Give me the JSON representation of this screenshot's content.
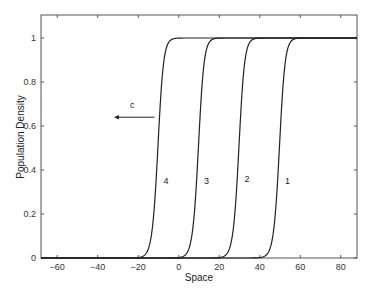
{
  "chart_data": {
    "type": "line",
    "title": "",
    "xlabel": "Space",
    "ylabel": "Population Density",
    "xlim": [
      -68,
      88
    ],
    "ylim": [
      0,
      1.08
    ],
    "xticks": [
      -60,
      -40,
      -20,
      0,
      20,
      40,
      60,
      80
    ],
    "xtick_labels": [
      "-60",
      "-40",
      "-20",
      "0",
      "20",
      "40",
      "60",
      "80"
    ],
    "yticks": [
      0,
      0.2,
      0.4,
      0.6,
      0.8,
      1
    ],
    "ytick_labels": [
      "0",
      "0.2",
      "0.4",
      "0.6",
      "0.8",
      "1"
    ],
    "grid": false,
    "legend": null,
    "series": [
      {
        "name": "1",
        "center": 50,
        "label_x": 52.5,
        "label_y": 0.35,
        "x": [
          -68,
          44,
          45,
          46,
          47,
          48,
          49,
          50,
          51,
          52,
          53,
          54,
          55,
          56,
          88
        ],
        "values": [
          0,
          0.0,
          0.01,
          0.02,
          0.05,
          0.12,
          0.24,
          0.42,
          0.62,
          0.79,
          0.9,
          0.96,
          0.99,
          1.0,
          1.0
        ]
      },
      {
        "name": "2",
        "center": 30,
        "label_x": 32.5,
        "label_y": 0.36,
        "x": [
          -68,
          24,
          25,
          26,
          27,
          28,
          29,
          30,
          31,
          32,
          33,
          34,
          35,
          36,
          88
        ],
        "values": [
          0,
          0.0,
          0.01,
          0.02,
          0.05,
          0.12,
          0.24,
          0.42,
          0.62,
          0.79,
          0.9,
          0.96,
          0.99,
          1.0,
          1.0
        ]
      },
      {
        "name": "3",
        "center": 10,
        "label_x": 12.5,
        "label_y": 0.35,
        "x": [
          -68,
          4,
          5,
          6,
          7,
          8,
          9,
          10,
          11,
          12,
          13,
          14,
          15,
          16,
          88
        ],
        "values": [
          0,
          0.0,
          0.01,
          0.02,
          0.05,
          0.12,
          0.24,
          0.42,
          0.62,
          0.79,
          0.9,
          0.96,
          0.99,
          1.0,
          1.0
        ]
      },
      {
        "name": "4",
        "center": -10,
        "label_x": -7.5,
        "label_y": 0.35,
        "x": [
          -68,
          -16,
          -15,
          -14,
          -13,
          -12,
          -11,
          -10,
          -9,
          -8,
          -7,
          -6,
          -5,
          -4,
          88
        ],
        "values": [
          0,
          0.0,
          0.01,
          0.02,
          0.05,
          0.12,
          0.24,
          0.42,
          0.62,
          0.79,
          0.9,
          0.96,
          0.99,
          1.0,
          1.0
        ]
      }
    ],
    "annotations": [
      {
        "text": "c",
        "x": -23,
        "y": 0.68,
        "type": "label"
      },
      {
        "type": "arrow",
        "from": [
          -12,
          0.64
        ],
        "to": [
          -32,
          0.64
        ],
        "meaning": "wave speed direction"
      }
    ]
  }
}
